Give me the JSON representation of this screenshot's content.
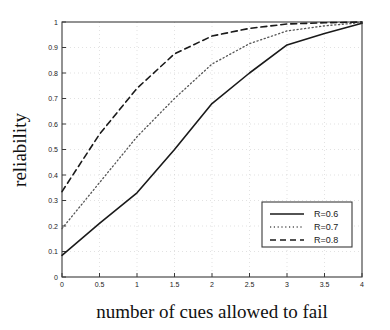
{
  "chart_data": {
    "type": "line",
    "title": "",
    "xlabel": "number of cues allowed to fail",
    "ylabel": "reliability",
    "xlim": [
      0,
      4
    ],
    "ylim": [
      0,
      1
    ],
    "grid": true,
    "legend_position": "lower right",
    "xticks": [
      "0",
      "0.5",
      "1",
      "1.5",
      "2",
      "2.5",
      "3",
      "3.5",
      "4"
    ],
    "xtick_values": [
      0,
      0.5,
      1,
      1.5,
      2,
      2.5,
      3,
      3.5,
      4
    ],
    "yticks": [
      "0",
      "0.1",
      "0.2",
      "0.3",
      "0.4",
      "0.5",
      "0.6",
      "0.7",
      "0.8",
      "0.9",
      "1"
    ],
    "ytick_values": [
      0,
      0.1,
      0.2,
      0.3,
      0.4,
      0.5,
      0.6,
      0.7,
      0.8,
      0.9,
      1
    ],
    "x": [
      0,
      0.5,
      1,
      1.5,
      2,
      2.5,
      3,
      3.5,
      4
    ],
    "series": [
      {
        "name": "R=0.6",
        "style": "solid",
        "color": "#1a1a1a",
        "values": [
          0.085,
          0.21,
          0.33,
          0.5,
          0.68,
          0.8,
          0.91,
          0.955,
          0.995
        ]
      },
      {
        "name": "R=0.7",
        "style": "dotted",
        "color": "#555555",
        "values": [
          0.19,
          0.37,
          0.55,
          0.7,
          0.835,
          0.915,
          0.965,
          0.985,
          0.998
        ]
      },
      {
        "name": "R=0.8",
        "style": "dashed",
        "color": "#1a1a1a",
        "values": [
          0.335,
          0.56,
          0.74,
          0.875,
          0.945,
          0.975,
          0.992,
          0.997,
          1.0
        ]
      }
    ]
  },
  "legend": {
    "entries": [
      {
        "label": "R=0.6",
        "style": "solid"
      },
      {
        "label": "R=0.7",
        "style": "dotted"
      },
      {
        "label": "R=0.8",
        "style": "dashed"
      }
    ]
  },
  "colors": {
    "axis": "#3a3a3a",
    "grid": "#cfcfcf",
    "text": "#1a1a1a",
    "background": "#ffffff"
  }
}
